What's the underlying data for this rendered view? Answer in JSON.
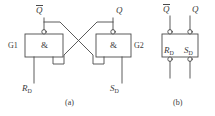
{
  "figure": {
    "panels": [
      {
        "id": "a",
        "caption": "(a)",
        "description": "Cross-coupled NAND latch made of two AND gates with inverting output bubbles",
        "gates": [
          {
            "name": "G1",
            "symbol": "&"
          },
          {
            "name": "G2",
            "symbol": "&"
          }
        ],
        "signals": {
          "q_bar": "Q",
          "q_bar_overline": true,
          "q": "Q",
          "r_d_letter": "R",
          "r_d_sub": "D",
          "s_d_letter": "S",
          "s_d_sub": "D"
        }
      },
      {
        "id": "b",
        "caption": "(b)",
        "description": "Block symbol of the basic SR latch with active-low set and reset inputs",
        "signals": {
          "q_bar": "Q",
          "q_bar_overline": true,
          "q": "Q",
          "r_d_letter": "R",
          "r_d_sub": "D",
          "s_d_letter": "S",
          "s_d_sub": "D"
        }
      }
    ],
    "colors": {
      "line": "#4a4a4a",
      "text": "#3a3a3a",
      "background": "#ffffff",
      "bubble_fill": "#ffffff"
    }
  }
}
